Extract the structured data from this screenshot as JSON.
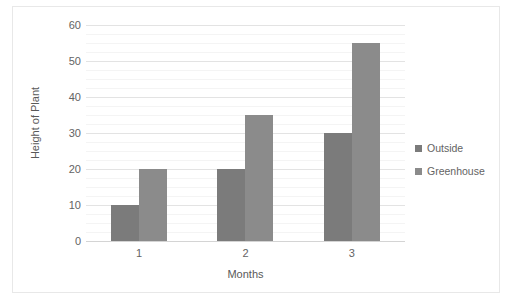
{
  "chart_data": {
    "type": "bar",
    "title": "",
    "subtitle": "",
    "xlabel": "Months",
    "ylabel": "Height of Plant",
    "categories": [
      "1",
      "2",
      "3"
    ],
    "series": [
      {
        "name": "Outside",
        "values": [
          10,
          20,
          30
        ],
        "color": "#7b7b7b"
      },
      {
        "name": "Greenhouse",
        "values": [
          20,
          35,
          55
        ],
        "color": "#8b8b8b"
      }
    ],
    "ylim": [
      0,
      60
    ],
    "ytick_step": 10,
    "yticks": [
      0,
      10,
      20,
      30,
      40,
      50,
      60
    ],
    "ytick_labels": [
      "0",
      "10",
      "20",
      "30",
      "40",
      "50",
      "60"
    ],
    "minor_gridline_step": 2.5,
    "grid": true,
    "grid_axis": "y",
    "legend_position": "right",
    "legend_entries": [
      "Outside",
      "Greenhouse"
    ],
    "annotations": [],
    "border_color": "#e8e8e8",
    "gridline_color": "#e3e3e3",
    "minor_gridline_color": "#f4f4f4",
    "axis_color": "#d4d4d4",
    "text_color": "#636363",
    "background": "#ffffff"
  }
}
